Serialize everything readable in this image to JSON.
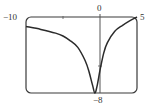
{
  "chart_data": {
    "type": "line",
    "title": "",
    "xlabel": "",
    "ylabel": "",
    "xlim": [
      -10,
      5
    ],
    "ylim": [
      -8,
      0
    ],
    "grid": false,
    "legend": null,
    "tick_labels": {
      "x_left": "−10",
      "x_right": "5",
      "y_top": "0",
      "y_bottom": "−8"
    },
    "series": [
      {
        "name": "f(x)",
        "x": [
          -10,
          -8,
          -6,
          -5,
          -4,
          -3,
          -2,
          -1.5,
          -1,
          -0.7,
          -0.4,
          0,
          0.5,
          1,
          2,
          3,
          4,
          5
        ],
        "y": [
          -1.0,
          -1.3,
          -1.7,
          -2.0,
          -2.5,
          -3.2,
          -4.6,
          -5.7,
          -7.2,
          -8.0,
          -7.3,
          -5.6,
          -3.8,
          -2.7,
          -1.5,
          -0.9,
          -0.4,
          0.0
        ]
      }
    ],
    "colors": {
      "curve": "#2b2b2b",
      "frame": "#3a3a3a",
      "axis": "#555555"
    }
  }
}
